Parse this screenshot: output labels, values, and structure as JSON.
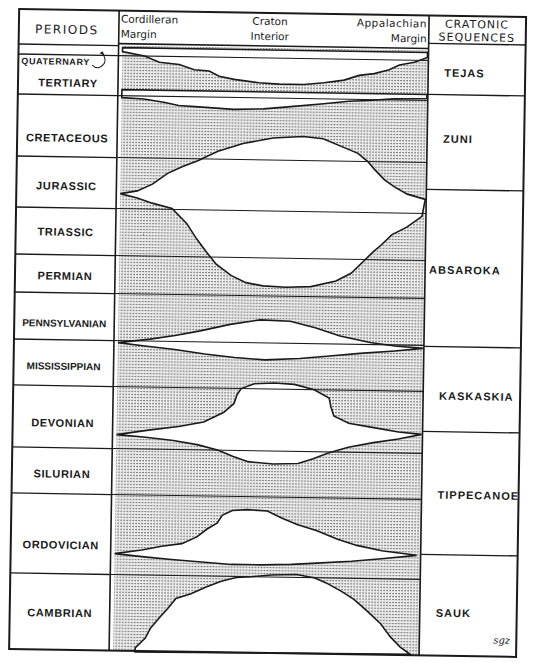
{
  "header": {
    "periods_label": "PERIODS",
    "col_left_line1": "Cordilleran",
    "col_left_line2": "Margin",
    "col_mid_line1": "Craton",
    "col_mid_line2": "Interior",
    "col_right_line1": "Appalachian",
    "col_right_line2": "Margin",
    "sequences_line1": "CRATONIC",
    "sequences_line2": "SEQUENCES"
  },
  "periods": [
    {
      "label": "QUATERNARY",
      "y": 68
    },
    {
      "label": "TERTIARY",
      "y": 90
    },
    {
      "label": "CRETACEOUS",
      "y": 145
    },
    {
      "label": "JURASSIC",
      "y": 193
    },
    {
      "label": "TRIASSIC",
      "y": 239
    },
    {
      "label": "PERMIAN",
      "y": 283
    },
    {
      "label": "PENNSYLVANIAN",
      "y": 330
    },
    {
      "label": "MISSISSIPPIAN",
      "y": 373
    },
    {
      "label": "DEVONIAN",
      "y": 430
    },
    {
      "label": "SILURIAN",
      "y": 481
    },
    {
      "label": "ORDOVICIAN",
      "y": 552
    },
    {
      "label": "CAMBRIAN",
      "y": 620
    }
  ],
  "period_boundaries_y": [
    48,
    58,
    98,
    160,
    211,
    258,
    296,
    343,
    389,
    451,
    497,
    577
  ],
  "sequences": [
    {
      "label": "TEJAS",
      "y": 74
    },
    {
      "label": "ZUNI",
      "y": 140
    },
    {
      "label": "ABSAROKA",
      "y": 271
    },
    {
      "label": "KASKASKIA",
      "y": 397
    },
    {
      "label": "TIPPECANOE",
      "y": 496
    },
    {
      "label": "SAUK",
      "y": 614
    }
  ],
  "sequence_boundaries_y": [
    41,
    92,
    187,
    344,
    429,
    552
  ],
  "signature": "sgz",
  "colors": {
    "ink": "#1a1a1a",
    "stipple": "#8a8a8a",
    "paper": "#ffffff"
  },
  "unconformity_gaps": [
    {
      "name": "gap-tejas-top",
      "points": "118,54 140,58 155,64 175,66 190,71 205,72 215,77 230,80 255,83 275,84 300,84 320,82 340,79 355,74 370,72 385,68 395,63 410,60 423,55 423,50 118,50"
    },
    {
      "name": "gap-tejas-zuni",
      "points": "118,100 140,101 160,104 175,107 195,108 230,110 260,109 290,106 320,103 345,100 365,99 390,97 423,96 423,92 118,92"
    },
    {
      "name": "gap-zuni-absaroka",
      "points": "118,196 135,193 150,186 165,175 180,168 195,162 215,152 240,144 270,138 300,136 320,138 340,146 355,152 365,160 372,168 382,178 392,185 405,192 423,197 420,214 405,225 390,233 380,243 372,250 362,260 350,272 335,280 310,286 285,287 262,286 245,283 230,276 215,265 205,253 195,240 185,225 170,210 150,205 135,200"
    },
    {
      "name": "gap-absaroka-kaskaskia",
      "points": "118,345 150,341 175,337 200,332 230,325 260,320 290,321 315,327 340,335 370,341 395,344 423,346 395,349 360,352 330,355 300,358 265,360 235,358 205,355 175,351 145,348"
    },
    {
      "name": "gap-kaskaskia-tippecanoe",
      "points": "118,437 150,432 180,428 205,423 225,413 235,404 238,395 242,389 255,384 275,383 295,384 315,389 330,397 332,406 335,415 350,422 375,426 400,430 423,432 400,437 375,441 350,446 330,452 315,458 300,463 275,464 250,462 235,457 220,451 200,446 175,442 145,439"
    },
    {
      "name": "gap-tippecanoe-sauk",
      "points": "118,556 145,552 165,548 185,545 200,538 210,530 220,524 225,516 235,511 250,510 270,511 285,518 300,524 320,530 340,538 360,544 385,549 420,553 385,557 355,560 325,562 295,564 265,565 235,565 205,563 175,561 150,559"
    },
    {
      "name": "gap-sauk-base",
      "points": "140,650 150,640 155,630 165,618 172,610 180,600 195,595 210,588 225,582 240,578 255,577 275,575 300,574 318,577 330,582 345,590 358,598 372,610 385,622 395,635 405,645 415,652 140,654"
    }
  ]
}
